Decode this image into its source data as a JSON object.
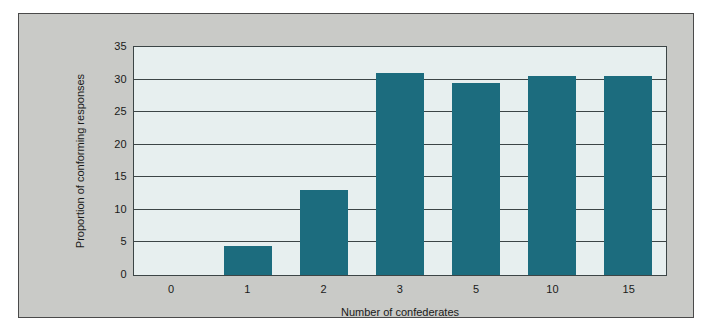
{
  "chart_data": {
    "type": "bar",
    "title": "",
    "subtitle": "",
    "xlabel": "Number of confederates",
    "ylabel": "Proportion of conforming responses",
    "categories": [
      "0",
      "1",
      "2",
      "3",
      "5",
      "10",
      "15"
    ],
    "values": [
      0,
      4.4,
      13,
      31,
      29.5,
      30.5,
      30.5
    ],
    "series": [
      {
        "name": "Proportion of conforming responses",
        "values": [
          0,
          4.4,
          13,
          31,
          29.5,
          30.5,
          30.5
        ]
      }
    ],
    "ylim": [
      0,
      35
    ],
    "yticks": [
      0,
      5,
      10,
      15,
      20,
      25,
      30,
      35
    ],
    "ytick_labels": [
      "0",
      "5",
      "10",
      "15",
      "20",
      "25",
      "30",
      "35"
    ],
    "grid": true,
    "grid_axis": "y",
    "legend": false,
    "legend_position": "none",
    "annotations": []
  },
  "style": {
    "bar_color": "#1c6c7e",
    "plot_background": "#e7efef",
    "figure_background": "#c9cac7",
    "gridline_color": "#3c4546",
    "axis_border_color": "#3c4546",
    "text_color": "#1a1a1a",
    "page_background": "#ffffff"
  }
}
